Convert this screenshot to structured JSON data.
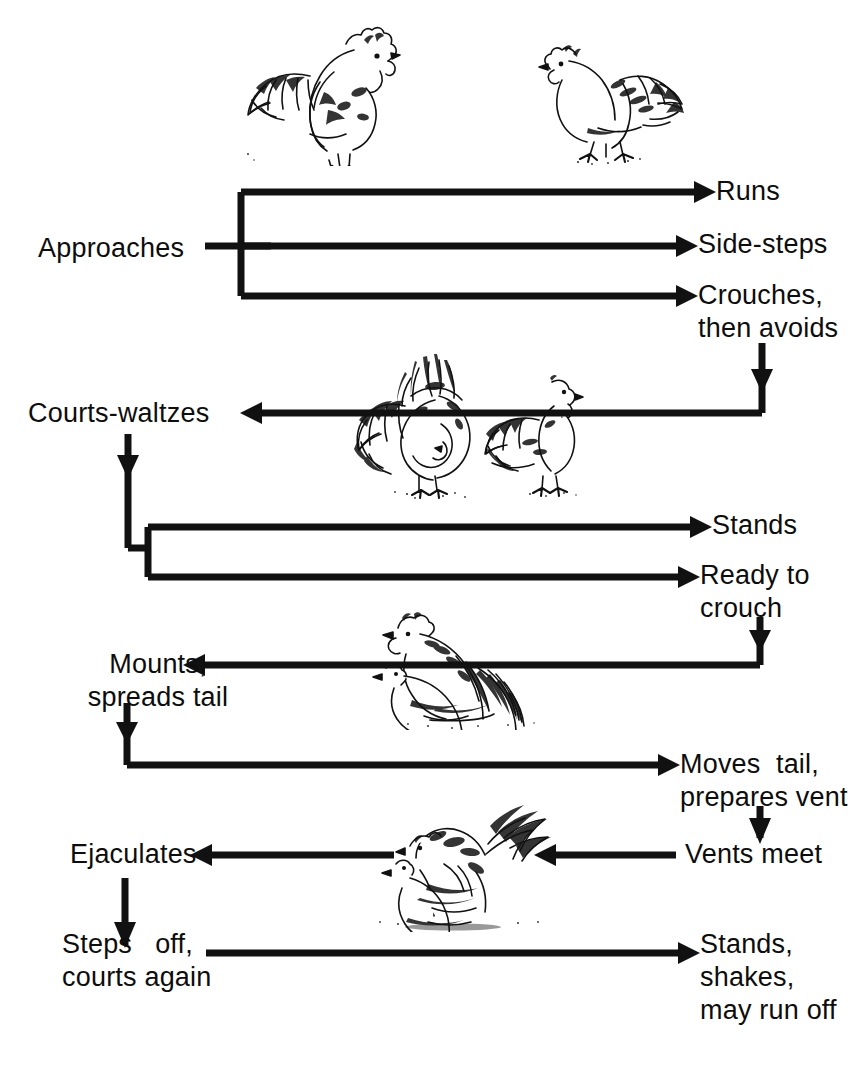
{
  "diagram": {
    "type": "flowchart",
    "line_color": "#111111",
    "background": "#ffffff",
    "nodes": [
      {
        "id": "approaches",
        "label": "Approaches",
        "x": 38,
        "y": 232,
        "align": "left"
      },
      {
        "id": "runs",
        "label": "Runs",
        "x": 716,
        "y": 175,
        "align": "left"
      },
      {
        "id": "side-steps",
        "label": "Side-steps",
        "x": 698,
        "y": 228,
        "align": "left"
      },
      {
        "id": "crouches",
        "label": "Crouches,\nthen avoids",
        "x": 698,
        "y": 279,
        "align": "left"
      },
      {
        "id": "courts-waltzes",
        "label": "Courts-waltzes",
        "x": 28,
        "y": 397,
        "align": "left"
      },
      {
        "id": "stands",
        "label": "Stands",
        "x": 712,
        "y": 509,
        "align": "left"
      },
      {
        "id": "ready-to-crouch",
        "label": "Ready to\ncrouch",
        "x": 700,
        "y": 559,
        "align": "left"
      },
      {
        "id": "mounts",
        "label": "Mounts,\nspreads tail",
        "x": 75,
        "y": 648,
        "align": "left"
      },
      {
        "id": "moves-tail",
        "label": "Moves  tail,\nprepares vent",
        "x": 680,
        "y": 748,
        "align": "left"
      },
      {
        "id": "vents-meet",
        "label": "Vents meet",
        "x": 685,
        "y": 838,
        "align": "left"
      },
      {
        "id": "ejaculates",
        "label": "Ejaculates",
        "x": 70,
        "y": 838,
        "align": "left"
      },
      {
        "id": "steps-off",
        "label": "Steps   off,\ncourts again",
        "x": 62,
        "y": 928,
        "align": "left"
      },
      {
        "id": "stands-shakes",
        "label": "Stands,\nshakes,\nmay run off",
        "x": 700,
        "y": 928,
        "align": "left"
      }
    ],
    "illustrations": [
      {
        "id": "rooster-standing",
        "caption": "rooster standing, facing right",
        "x": 228,
        "y": 14,
        "w": 180,
        "h": 150
      },
      {
        "id": "hen-walking",
        "caption": "hen walking, facing left",
        "x": 530,
        "y": 24,
        "w": 175,
        "h": 140
      },
      {
        "id": "rooster-waltzing",
        "caption": "rooster waltzing with lowered wing",
        "x": 345,
        "y": 352,
        "w": 160,
        "h": 145
      },
      {
        "id": "hen-standing-small",
        "caption": "hen standing, facing right",
        "x": 470,
        "y": 366,
        "w": 120,
        "h": 130
      },
      {
        "id": "rooster-mounting",
        "caption": "rooster mounting crouching hen",
        "x": 372,
        "y": 608,
        "w": 190,
        "h": 120
      },
      {
        "id": "pair-mating",
        "caption": "rooster and hen completing mating",
        "x": 360,
        "y": 800,
        "w": 225,
        "h": 130
      }
    ],
    "edges": [
      {
        "from": "approaches",
        "to": "runs",
        "kind": "branch-right"
      },
      {
        "from": "approaches",
        "to": "side-steps",
        "kind": "straight-right"
      },
      {
        "from": "approaches",
        "to": "crouches",
        "kind": "branch-right"
      },
      {
        "from": "crouches",
        "to": "courts-waltzes",
        "kind": "down-then-left"
      },
      {
        "from": "courts-waltzes",
        "to": "stands",
        "kind": "down-then-branch-right"
      },
      {
        "from": "courts-waltzes",
        "to": "ready-to-crouch",
        "kind": "down-then-branch-right"
      },
      {
        "from": "ready-to-crouch",
        "to": "mounts",
        "kind": "down-then-left"
      },
      {
        "from": "mounts",
        "to": "moves-tail",
        "kind": "down-then-right"
      },
      {
        "from": "moves-tail",
        "to": "vents-meet",
        "kind": "down"
      },
      {
        "from": "vents-meet",
        "to": "ejaculates",
        "kind": "left"
      },
      {
        "from": "ejaculates",
        "to": "steps-off",
        "kind": "down"
      },
      {
        "from": "steps-off",
        "to": "stands-shakes",
        "kind": "right"
      }
    ]
  }
}
